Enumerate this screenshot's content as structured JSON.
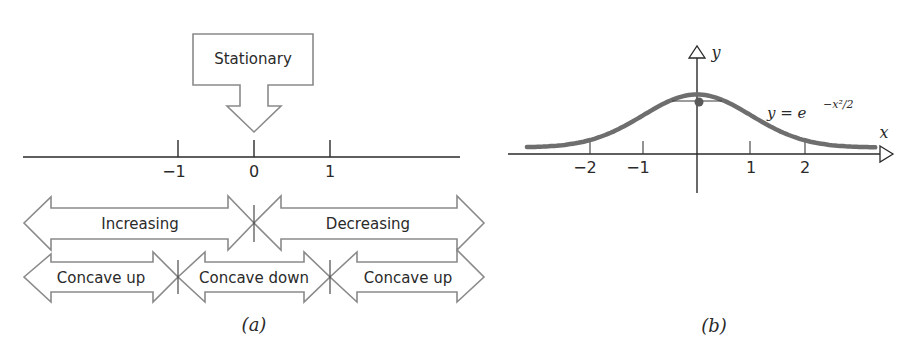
{
  "panel_a": {
    "caption": "(a)",
    "stationary_label": "Stationary",
    "number_line": {
      "ticks": [
        {
          "value": -1,
          "label": "−1"
        },
        {
          "value": 0,
          "label": "0"
        },
        {
          "value": 1,
          "label": "1"
        }
      ]
    },
    "monotonic_row": [
      {
        "label": "Increasing",
        "interval": "(-inf, 0)"
      },
      {
        "label": "Decreasing",
        "interval": "(0, inf)"
      }
    ],
    "concavity_row": [
      {
        "label": "Concave up",
        "interval": "(-inf, -1)"
      },
      {
        "label": "Concave down",
        "interval": "(-1, 1)"
      },
      {
        "label": "Concave up",
        "interval": "(1, inf)"
      }
    ]
  },
  "panel_b": {
    "caption": "(b)",
    "x_axis_label": "x",
    "y_axis_label": "y",
    "equation": {
      "lhs": "y = e",
      "exponent": "−x²/2"
    },
    "x_ticks": [
      {
        "value": -2,
        "label": "−2"
      },
      {
        "value": -1,
        "label": "−1"
      },
      {
        "value": 1,
        "label": "1"
      },
      {
        "value": 2,
        "label": "2"
      }
    ],
    "curve_color": "#6e6e6e",
    "max_point": {
      "x": 0,
      "y": 1
    }
  },
  "chart_data": {
    "type": "line",
    "title": "",
    "xlabel": "x",
    "ylabel": "y",
    "series": [
      {
        "name": "y = e^(-x^2/2)",
        "x": [
          -3,
          -2.5,
          -2,
          -1.5,
          -1,
          -0.5,
          0,
          0.5,
          1,
          1.5,
          2,
          2.5,
          3
        ],
        "values": [
          0.011,
          0.044,
          0.135,
          0.325,
          0.607,
          0.882,
          1.0,
          0.882,
          0.607,
          0.325,
          0.135,
          0.044,
          0.011
        ]
      }
    ],
    "xticks": [
      -2,
      -1,
      1,
      2
    ],
    "xlim": [
      -3.5,
      3.5
    ],
    "ylim": [
      0,
      1.6
    ],
    "grid": false,
    "annotations": [
      "horizontal tangent at (0,1)",
      "y = e^{-x^2/2}"
    ]
  }
}
